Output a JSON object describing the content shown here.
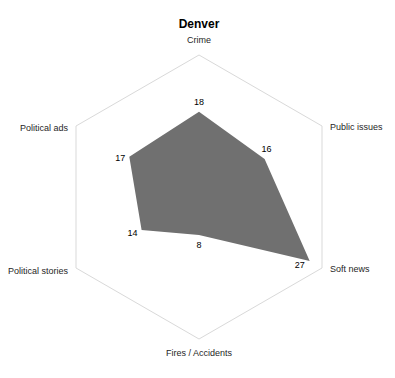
{
  "chart_data": {
    "type": "radar",
    "title": "Denver",
    "categories": [
      "Crime",
      "Public issues",
      "Soft news",
      "Fires / Accidents",
      "Political stories",
      "Political ads"
    ],
    "series": [
      {
        "name": "Denver",
        "values": [
          18,
          16,
          27,
          8,
          14,
          17
        ],
        "color": "#707070"
      }
    ],
    "range": [
      0,
      30
    ],
    "gridlines": "outer ring only",
    "data_labels": true,
    "legend": "none"
  },
  "colors": {
    "fill": "#707070",
    "grid": "#d9d9d9",
    "text": "#262626"
  }
}
